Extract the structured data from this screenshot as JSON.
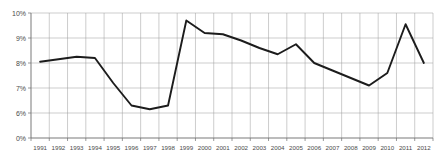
{
  "chart_data": {
    "type": "line",
    "title": "",
    "xlabel": "",
    "ylabel": "",
    "categories": [
      "1991",
      "1992",
      "1993",
      "1994",
      "1995",
      "1996",
      "1997",
      "1998",
      "1999",
      "2000",
      "2001",
      "2002",
      "2003",
      "2004",
      "2005",
      "2006",
      "2007",
      "2008",
      "2009",
      "2010",
      "2011",
      "2012"
    ],
    "values": [
      8.05,
      8.15,
      8.25,
      8.2,
      7.2,
      6.3,
      6.15,
      6.3,
      9.7,
      9.2,
      9.15,
      8.9,
      8.6,
      8.35,
      8.75,
      8.0,
      7.7,
      7.4,
      7.1,
      7.6,
      9.55,
      8.0
    ],
    "ylim": [
      5,
      10
    ],
    "yticks": [
      10,
      9,
      8,
      7,
      6,
      5
    ],
    "ytick_labels": [
      "10%",
      "9%",
      "8%",
      "7%",
      "6%",
      "0%"
    ],
    "grid": true,
    "legend": "none",
    "series": [
      {
        "name": "series-1",
        "points": [
          {
            "x": "1991",
            "y": 8.05
          },
          {
            "x": "1992",
            "y": 8.15
          },
          {
            "x": "1993",
            "y": 8.25
          },
          {
            "x": "1994",
            "y": 8.2
          },
          {
            "x": "1995",
            "y": 7.2
          },
          {
            "x": "1996",
            "y": 6.3
          },
          {
            "x": "1997",
            "y": 6.15
          },
          {
            "x": "1998",
            "y": 6.3
          },
          {
            "x": "1999",
            "y": 9.7
          },
          {
            "x": "2000",
            "y": 9.2
          },
          {
            "x": "2001",
            "y": 9.15
          },
          {
            "x": "2002",
            "y": 8.9
          },
          {
            "x": "2003",
            "y": 8.6
          },
          {
            "x": "2004",
            "y": 8.35
          },
          {
            "x": "2005",
            "y": 8.75
          },
          {
            "x": "2006",
            "y": 8.0
          },
          {
            "x": "2007",
            "y": 7.7
          },
          {
            "x": "2008",
            "y": 7.4
          },
          {
            "x": "2009",
            "y": 7.1
          },
          {
            "x": "2010",
            "y": 7.6
          },
          {
            "x": "2011",
            "y": 9.55
          },
          {
            "x": "2012",
            "y": 8.0
          }
        ]
      }
    ],
    "colors": {
      "line": "#1c1c1c",
      "grid": "#9a9a9a",
      "axis": "#6e6e6e",
      "tick_text": "#4a4a4a",
      "background": "#ffffff"
    }
  }
}
